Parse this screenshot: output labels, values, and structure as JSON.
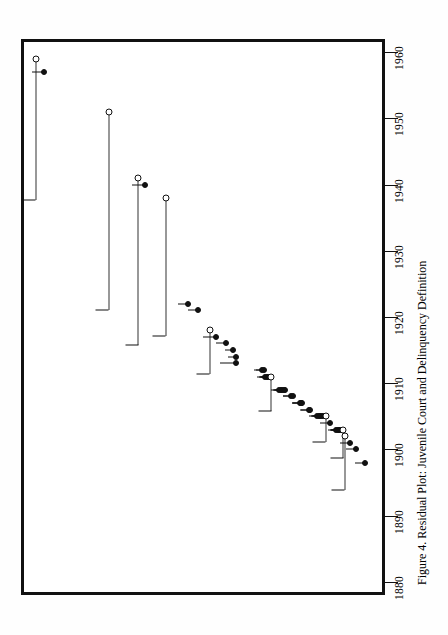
{
  "figure": {
    "caption": "Figure 4.  Residual Plot: Juvenile Court and Delinquency Definition",
    "orientation": "rotated-90-ccw",
    "frame_color": "#111111"
  },
  "chart_data": {
    "type": "scatter",
    "title": "Residual Plot: Juvenile Court and Delinquency Definition",
    "xlabel": "Year of adoption",
    "ylabel": "Residual",
    "xlim": [
      1880,
      1962
    ],
    "grid": false,
    "legend": null,
    "axis_ticks": [
      1880,
      1890,
      1900,
      1910,
      1920,
      1930,
      1940,
      1950,
      1960
    ],
    "note": "x = year (plotted sideways, 1880 at bottom); y = residual, increasing toward the left edge. Open circles carry an interval bar running toward larger residual.",
    "points": [
      {
        "year": 1959,
        "residual": 0.955,
        "marker": "open",
        "interval_to": 0.52,
        "tie": 0
      },
      {
        "year": 1957,
        "residual": 0.93,
        "marker": "filled",
        "tie": 12
      },
      {
        "year": 1951,
        "residual": 0.73,
        "marker": "open",
        "interval_to": 0.12,
        "tie": 0
      },
      {
        "year": 1941,
        "residual": 0.64,
        "marker": "open",
        "interval_to": 0.125,
        "tie": 0
      },
      {
        "year": 1940,
        "residual": 0.62,
        "marker": "filled",
        "tie": 13
      },
      {
        "year": 1938,
        "residual": 0.555,
        "marker": "open",
        "interval_to": 0.13,
        "tie": 0
      },
      {
        "year": 1922,
        "residual": 0.485,
        "marker": "filled",
        "tie": 10
      },
      {
        "year": 1921,
        "residual": 0.455,
        "marker": "filled",
        "tie": 10
      },
      {
        "year": 1918,
        "residual": 0.42,
        "marker": "open",
        "interval_to": 0.285,
        "tie": 0
      },
      {
        "year": 1917,
        "residual": 0.4,
        "marker": "filled",
        "tie": 13
      },
      {
        "year": 1916,
        "residual": 0.37,
        "marker": "filled",
        "tie": 10
      },
      {
        "year": 1915,
        "residual": 0.348,
        "marker": "filled",
        "tie": 8
      },
      {
        "year": 1914,
        "residual": 0.34,
        "marker": "filled",
        "tie": 8
      },
      {
        "year": 1913,
        "residual": 0.338,
        "marker": "filled",
        "tie": 16
      },
      {
        "year": 1912,
        "residual": 0.258,
        "marker": "filled",
        "tie": 8
      },
      {
        "year": 1912,
        "residual": 0.252,
        "marker": "filled",
        "tie": 8
      },
      {
        "year": 1911,
        "residual": 0.248,
        "marker": "filled",
        "tie": 8
      },
      {
        "year": 1911,
        "residual": 0.244,
        "marker": "filled",
        "tie": 8
      },
      {
        "year": 1911,
        "residual": 0.24,
        "marker": "filled",
        "tie": 8
      },
      {
        "year": 1911,
        "residual": 0.236,
        "marker": "filled",
        "tie": 8
      },
      {
        "year": 1911,
        "residual": 0.23,
        "marker": "open",
        "interval_to": 0.125,
        "tie": 0
      },
      {
        "year": 1909,
        "residual": 0.205,
        "marker": "filled",
        "tie": 8
      },
      {
        "year": 1909,
        "residual": 0.2,
        "marker": "filled",
        "tie": 8
      },
      {
        "year": 1909,
        "residual": 0.196,
        "marker": "filled",
        "tie": 8
      },
      {
        "year": 1909,
        "residual": 0.192,
        "marker": "filled",
        "tie": 8
      },
      {
        "year": 1909,
        "residual": 0.188,
        "marker": "filled",
        "tie": 10
      },
      {
        "year": 1908,
        "residual": 0.168,
        "marker": "filled",
        "tie": 8
      },
      {
        "year": 1908,
        "residual": 0.162,
        "marker": "filled",
        "tie": 10
      },
      {
        "year": 1907,
        "residual": 0.142,
        "marker": "filled",
        "tie": 8
      },
      {
        "year": 1907,
        "residual": 0.138,
        "marker": "filled",
        "tie": 8
      },
      {
        "year": 1907,
        "residual": 0.134,
        "marker": "filled",
        "tie": 10
      },
      {
        "year": 1906,
        "residual": 0.115,
        "marker": "filled",
        "tie": 8
      },
      {
        "year": 1906,
        "residual": 0.11,
        "marker": "filled",
        "tie": 10
      },
      {
        "year": 1905,
        "residual": 0.088,
        "marker": "filled",
        "tie": 8
      },
      {
        "year": 1905,
        "residual": 0.084,
        "marker": "filled",
        "tie": 8
      },
      {
        "year": 1905,
        "residual": 0.08,
        "marker": "filled",
        "tie": 8
      },
      {
        "year": 1905,
        "residual": 0.076,
        "marker": "filled",
        "tie": 8
      },
      {
        "year": 1905,
        "residual": 0.072,
        "marker": "filled",
        "tie": 8
      },
      {
        "year": 1905,
        "residual": 0.068,
        "marker": "filled",
        "tie": 8
      },
      {
        "year": 1905,
        "residual": 0.062,
        "marker": "open",
        "interval_to": 0.14,
        "tie": 0
      },
      {
        "year": 1904,
        "residual": 0.048,
        "marker": "filled",
        "tie": 10
      },
      {
        "year": 1903,
        "residual": 0.03,
        "marker": "filled",
        "tie": 8
      },
      {
        "year": 1903,
        "residual": 0.026,
        "marker": "filled",
        "tie": 8
      },
      {
        "year": 1903,
        "residual": 0.022,
        "marker": "filled",
        "tie": 8
      },
      {
        "year": 1903,
        "residual": 0.018,
        "marker": "filled",
        "tie": 8
      },
      {
        "year": 1903,
        "residual": 0.014,
        "marker": "filled",
        "tie": 10
      },
      {
        "year": 1903,
        "residual": 0.008,
        "marker": "open",
        "interval_to": 0.095,
        "tie": 0
      },
      {
        "year": 1902,
        "residual": 0.004,
        "marker": "open",
        "interval_to": 0.17,
        "tie": 0
      },
      {
        "year": 1901,
        "residual": -0.012,
        "marker": "filled",
        "tie": 10
      },
      {
        "year": 1900,
        "residual": -0.032,
        "marker": "filled",
        "tie": 10
      },
      {
        "year": 1898,
        "residual": -0.058,
        "marker": "filled",
        "tie": 10
      }
    ]
  }
}
